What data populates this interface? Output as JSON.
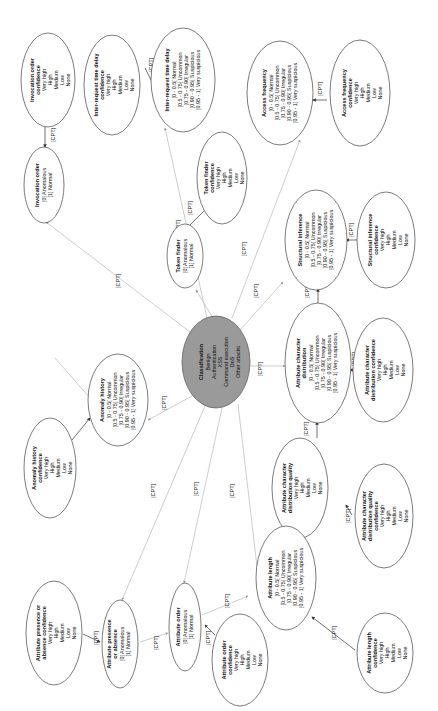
{
  "diagram": {
    "type": "bayesian-network",
    "orientation": "rotated-90-ccw",
    "edge_label": "[CPT]",
    "central": {
      "title": "Classification",
      "states": [
        "Benign",
        "Authentication",
        "XSS",
        "Command execution",
        "DoS",
        "Other attacks"
      ]
    },
    "nodes": {
      "invocation_order": {
        "title": "Invocation order",
        "states": [
          "[0] Anomalous",
          "[1] Normal"
        ]
      },
      "invocation_order_conf": {
        "title": "Invocation order confidence",
        "states": [
          "Very high",
          "High",
          "Medium",
          "Low",
          "None"
        ]
      },
      "inter_request": {
        "title": "Inter-request time delay",
        "states": [
          "[0 - 0.5[ Normal",
          "[0.5 - 0.75[ Uncommon",
          "[0.75 - 0.90[ Irregular",
          "[0.90 - 0.95[ Suspicious",
          "[0.95 - 1] Very suspicious"
        ]
      },
      "inter_request_conf": {
        "title": "Inter-request time delay confidence",
        "states": [
          "Very high",
          "High",
          "Medium",
          "Low",
          "None"
        ]
      },
      "token_finder": {
        "title": "Token finder",
        "states": [
          "[0] Anomalous",
          "[1] Normal"
        ]
      },
      "token_finder_conf": {
        "title": "Token finder confidence",
        "states": [
          "Very high",
          "High",
          "Medium",
          "Low",
          "None"
        ]
      },
      "access_frequency": {
        "title": "Access frequency",
        "states": [
          "[0 - 0.5[ Normal",
          "[0.5 - 0.75[ Uncommon",
          "[0.75 - 0.90[ Irregular",
          "[0.90 - 0.95[ Suspicious",
          "[0.95 - 1] Very suspicious"
        ]
      },
      "access_frequency_conf": {
        "title": "Access frequency confidence",
        "states": [
          "Very high",
          "High",
          "Medium",
          "Low",
          "None"
        ]
      },
      "structural": {
        "title": "Structural inference",
        "states": [
          "[0 - 0.5[ Normal",
          "[0.5 - 0.75[ Uncommon",
          "[0.75 - 0.90[ Irregular",
          "[0.90 - 0.95[ Suspicious",
          "[0.95 - 1] Very suspicious"
        ]
      },
      "structural_conf": {
        "title": "Structural inference confidence",
        "states": [
          "Very high",
          "High",
          "Medium",
          "Low",
          "None"
        ]
      },
      "attr_char_dist": {
        "title": "Attribute character distribution",
        "states": [
          "[0 - 0.5[ Normal",
          "[0.5 - 0.75[ Uncommon",
          "[0.75 - 0.90[ Irregular",
          "[0.90 - 0.95[ Suspicious",
          "[0.95 - 1] Very suspicious"
        ]
      },
      "attr_char_dist_conf": {
        "title": "Attribute character distribution confidence",
        "states": [
          "Very high",
          "High",
          "Medium",
          "Low",
          "None"
        ]
      },
      "attr_char_dist_quality": {
        "title": "Attribute character distribution quality",
        "states": [
          "Very high",
          "High",
          "Medium",
          "Low",
          "None"
        ]
      },
      "attr_char_dist_quality_conf": {
        "title": "Attribute character distribution quality confidence",
        "states": [
          "Very high",
          "High",
          "Medium",
          "Low",
          "None"
        ]
      },
      "attr_length": {
        "title": "Attribute length",
        "states": [
          "[0 - 0.5[ Normal",
          "[0.5 - 0.75[ Uncommon",
          "[0.75 - 0.90[ Irregular",
          "[0.90 - 0.95[ Suspicious",
          "[0.95 - 1] Very suspicious"
        ]
      },
      "attr_length_conf": {
        "title": "Attribute length confidence",
        "states": [
          "Very high",
          "High",
          "Medium",
          "Low",
          "None"
        ]
      },
      "attr_order": {
        "title": "Attribute order",
        "states": [
          "[0] Anomalous",
          "[1] Normal"
        ]
      },
      "attr_order_conf": {
        "title": "Attribute order confidence",
        "states": [
          "Very high",
          "High",
          "Medium",
          "Low",
          "None"
        ]
      },
      "attr_presence": {
        "title": "Attribute presence or absence",
        "states": [
          "[0] Anomalous",
          "[1] Normal"
        ]
      },
      "attr_presence_conf": {
        "title": "Attribute presence or absence confidence",
        "states": [
          "Very high",
          "High",
          "Medium",
          "Low",
          "None"
        ]
      },
      "anomaly_history": {
        "title": "Anomaly history",
        "states": [
          "[0 - 0.5[ Normal",
          "[0.5 - 0.75[ Uncommon",
          "[0.75 - 0.90[ Irregular",
          "[0.90 - 0.95[ Suspicious",
          "[0.95 - 1] Very suspicious"
        ]
      },
      "anomaly_history_conf": {
        "title": "Anomaly history confidence",
        "states": [
          "Very high",
          "High",
          "Medium",
          "Low",
          "None"
        ]
      }
    }
  }
}
